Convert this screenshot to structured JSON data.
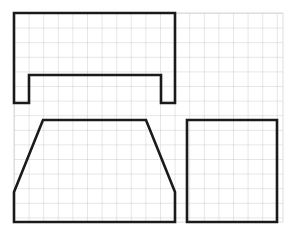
{
  "document": {
    "title": "Orthographic multiview sketch on graph paper",
    "medium": "graph-paper",
    "background_color": "#ffffff"
  },
  "grid": {
    "name": "graph-paper-grid",
    "line_color": "#b9b9b9",
    "line_width": 0.7,
    "cell_size": 14.6,
    "x_start": 14,
    "y_start": 13,
    "x_end": 283,
    "y_end": 222,
    "columns": 19,
    "rows": 15
  },
  "style": {
    "outline_color": "#1a1a1a",
    "outline_width": 2.6,
    "fill": "none"
  },
  "views": [
    {
      "id": "top-view",
      "label": "Notched rectangle view",
      "shape_type": "u-channel-outline",
      "points": "14,13 175,13 175,103 161,103 161,75 29,75 29,103 14,103",
      "bounds": {
        "x": 14,
        "y": 13,
        "width": 161,
        "height": 90
      },
      "notes": "Rectangle with a rectangular notch cut from the bottom edge leaving two legs"
    },
    {
      "id": "front-view",
      "label": "Trapezoid view",
      "shape_type": "trapezoid-with-vertical-sides",
      "points": "43,120 146,120 175,192 175,222 14,222 14,192",
      "bounds": {
        "x": 14,
        "y": 120,
        "width": 161,
        "height": 102
      },
      "notes": "Trapezoid top with sloped sides meeting vertical lower sides"
    },
    {
      "id": "side-view",
      "label": "Rectangle view",
      "shape_type": "rectangle",
      "points": "187,120 277,120 277,222 187,222",
      "bounds": {
        "x": 187,
        "y": 120,
        "width": 90,
        "height": 102
      },
      "notes": "Plain rectangle"
    }
  ]
}
